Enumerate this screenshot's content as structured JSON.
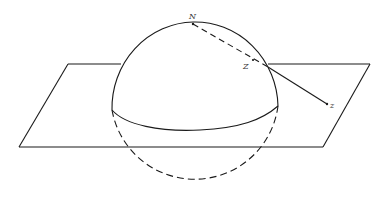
{
  "figure": {
    "labels": {
      "north_pole": "N",
      "sphere_point": "Z",
      "projected_point": "z"
    },
    "colors": {
      "stroke": "#1a1a1a",
      "background": "#ffffff"
    }
  }
}
